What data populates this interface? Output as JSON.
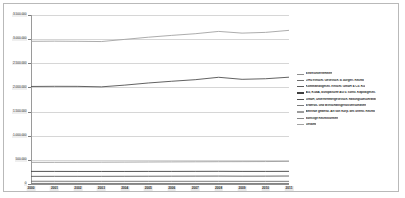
{
  "chart_data": {
    "type": "line",
    "title": "",
    "xlabel": "",
    "ylabel": "",
    "grid": true,
    "legend_position": "right",
    "ylim": [
      0,
      3500000
    ],
    "ytick_step": 500000,
    "ytick_labels": [
      "3.500.000",
      "3.000.000",
      "2.500.000",
      "2.000.000",
      "1.500.000",
      "1.000.000",
      "500.000",
      "0"
    ],
    "ytick_values": [
      3500000,
      3000000,
      2500000,
      2000000,
      1500000,
      1000000,
      500000,
      0
    ],
    "categories": [
      "2000",
      "2001",
      "2002",
      "2003",
      "2004",
      "2005",
      "2006",
      "2007",
      "2008",
      "2009",
      "2010",
      "2011"
    ],
    "series": [
      {
        "name": "Einzelunternehmen",
        "color": "#8f8f8f",
        "values": [
          12000,
          12000,
          12000,
          11000,
          11000,
          11000,
          11000,
          11000,
          11000,
          11000,
          11000,
          11000
        ]
      },
      {
        "name": "OHG einschl. Gesellsch. d. bürgerl. Rechts",
        "color": "#6e6e6e",
        "values": [
          57000,
          57000,
          56000,
          56000,
          56000,
          56000,
          56000,
          56000,
          56000,
          55000,
          55000,
          55000
        ]
      },
      {
        "name": "Kommanditgesell. einschl. GmbH & Co. KG",
        "color": "#5a5a5a",
        "values": [
          158000,
          159000,
          159000,
          159000,
          160000,
          161000,
          162000,
          163000,
          164000,
          162000,
          163000,
          165000
        ]
      },
      {
        "name": "AG, KGaA, Europäische AG u. sonst. Kapitalgesell.",
        "color": "#3f3f3f",
        "values": [
          261000,
          261000,
          260000,
          260000,
          260000,
          261000,
          261000,
          262000,
          263000,
          261000,
          261000,
          262000
        ]
      },
      {
        "name": "GmbH, Unternehmergesellsch. haftungsbeschränkt",
        "color": "#505050",
        "values": [
          2020000,
          2023000,
          2022000,
          2012000,
          2048000,
          2092000,
          2128000,
          2160000,
          2210000,
          2168000,
          2180000,
          2212000
        ]
      },
      {
        "name": "Erwerbs- und Wirtschaftsgenossenschaften",
        "color": "#7a7a7a",
        "values": [
          9000,
          9000,
          9000,
          9000,
          9000,
          9000,
          9000,
          9000,
          9000,
          9000,
          9000,
          9000
        ]
      },
      {
        "name": "Betriebe gewerbl. Art von Körp. des öffentl. Rechts",
        "color": "#9c9c9c",
        "values": [
          448000,
          449000,
          450000,
          452000,
          454000,
          456000,
          458000,
          460000,
          462000,
          463000,
          465000,
          468000
        ]
      },
      {
        "name": "Sonstige Rechtsformen",
        "color": "#888888",
        "values": [
          4000,
          4000,
          4000,
          4000,
          4000,
          4000,
          4000,
          4000,
          4000,
          4000,
          4000,
          4000
        ]
      },
      {
        "name": "Gesamt",
        "color": "#a3a3a3",
        "values": [
          2955000,
          2958000,
          2955000,
          2950000,
          2995000,
          3040000,
          3078000,
          3112000,
          3160000,
          3125000,
          3140000,
          3182000
        ]
      }
    ]
  }
}
